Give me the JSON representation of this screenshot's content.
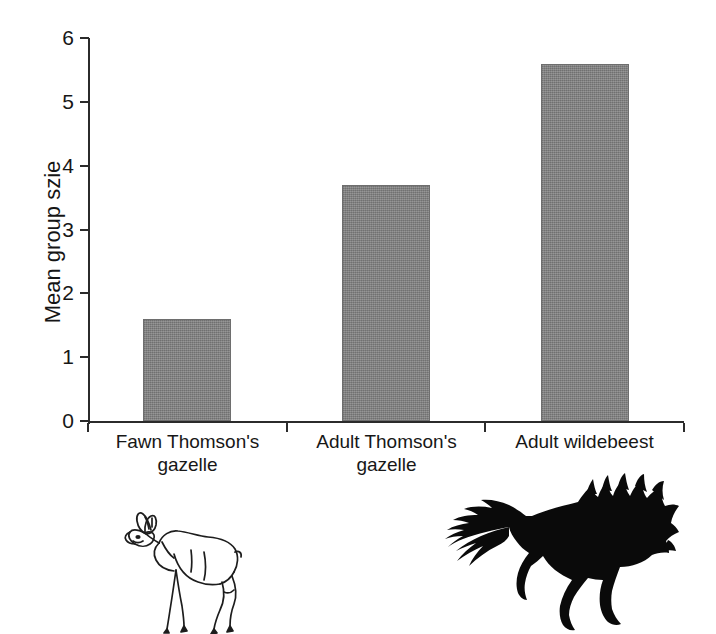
{
  "figure": {
    "background_color": "#ffffff",
    "axis_color": "#2b2b2b",
    "bar_color": "#808080",
    "text_color": "#171717"
  },
  "chart_data": {
    "type": "bar",
    "title": "",
    "subtitle": "",
    "xlabel": "",
    "ylabel": "Mean group szie",
    "categories": [
      "Fawn Thomson's gazelle",
      "Adult Thomson's gazelle",
      "Adult wildebeest"
    ],
    "category_lines": [
      [
        "Fawn Thomson's",
        "gazelle"
      ],
      [
        "Adult Thomson's",
        "gazelle"
      ],
      [
        "Adult wildebeest"
      ]
    ],
    "values": [
      1.6,
      3.7,
      5.6
    ],
    "ylim": [
      0,
      6
    ],
    "ytick_labels": [
      "0",
      "1",
      "2",
      "3",
      "4",
      "5",
      "6"
    ],
    "ytick_values": [
      0,
      1,
      2,
      3,
      4,
      5,
      6
    ],
    "grid": false,
    "legend": null,
    "legend_position": "none",
    "bar_fill": "dithered-gray"
  },
  "annotations": {
    "images": [
      {
        "name": "gazelle-fawn-line-drawing",
        "description": "Outline line drawing of a Thomson's gazelle fawn standing, facing left",
        "style": "outline",
        "under_category": "Fawn Thomson's gazelle"
      },
      {
        "name": "wildebeest-silhouette",
        "description": "Solid black silhouette of an adult wildebeest running to the right with mane and tufted tail",
        "style": "solid-silhouette",
        "under_category": "Adult wildebeest"
      }
    ]
  }
}
